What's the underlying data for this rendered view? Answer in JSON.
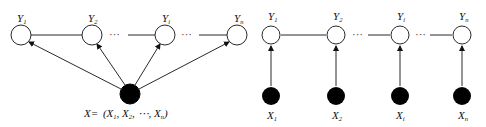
{
  "diagram": {
    "left": {
      "title": "CRF with shared input X",
      "y_nodes": [
        {
          "name": "Y",
          "sub": "1",
          "cx": 21,
          "cy": 35
        },
        {
          "name": "Y",
          "sub": "2",
          "cx": 92,
          "cy": 35
        },
        {
          "name": "Y",
          "sub": "i",
          "cx": 165,
          "cy": 35
        },
        {
          "name": "Y",
          "sub": "n",
          "cx": 237,
          "cy": 35
        }
      ],
      "x_node": {
        "cx": 130,
        "cy": 94,
        "label": "X= (X₁, X₂, ⋯, Xₙ)"
      },
      "formula": {
        "lhs": "X=",
        "parts": [
          {
            "name": "X",
            "sub": "1"
          },
          {
            "name": "X",
            "sub": "2"
          },
          {
            "name": "⋯",
            "sub": ""
          },
          {
            "name": "X",
            "sub": "n"
          }
        ]
      },
      "ellipsis": [
        "···",
        "···"
      ]
    },
    "right": {
      "title": "Linear-chain CRF",
      "y_nodes": [
        {
          "name": "Y",
          "sub": "1",
          "cx": 271,
          "cy": 35
        },
        {
          "name": "Y",
          "sub": "2",
          "cx": 336,
          "cy": 35
        },
        {
          "name": "Y",
          "sub": "i",
          "cx": 400,
          "cy": 35
        },
        {
          "name": "Y",
          "sub": "n",
          "cx": 462,
          "cy": 35
        }
      ],
      "x_nodes": [
        {
          "name": "X",
          "sub": "1",
          "cx": 271,
          "cy": 96
        },
        {
          "name": "X",
          "sub": "2",
          "cx": 336,
          "cy": 96
        },
        {
          "name": "X",
          "sub": "i",
          "cx": 400,
          "cy": 96
        },
        {
          "name": "X",
          "sub": "n",
          "cx": 462,
          "cy": 96
        }
      ],
      "ellipsis": [
        "···",
        "···"
      ]
    },
    "colors": {
      "stroke": "#2a2a2a",
      "observed_fill": "#000000",
      "hidden_fill": "#ffffff"
    }
  }
}
